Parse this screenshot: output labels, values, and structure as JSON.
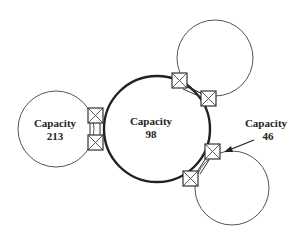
{
  "diagram": {
    "nodes": [
      {
        "id": "center",
        "label": "Capacity",
        "value": "98"
      },
      {
        "id": "left",
        "label": "Capacity",
        "value": "213"
      },
      {
        "id": "top-right",
        "label": "",
        "value": ""
      },
      {
        "id": "bottom-right",
        "label": "Capacity",
        "value": "46"
      }
    ],
    "colors": {
      "stroke": "#333333",
      "background": "#ffffff"
    }
  }
}
